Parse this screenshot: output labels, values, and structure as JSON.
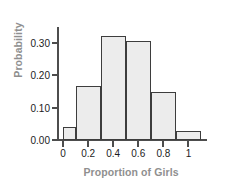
{
  "chart_data": {
    "type": "bar",
    "title": "",
    "subtitle": "",
    "xlabel": "Proportion of Girls",
    "ylabel": "Probability",
    "categories": [
      "0.0-0.1",
      "0.1-0.3",
      "0.3-0.5",
      "0.5-0.7",
      "0.7-0.9",
      "0.9-1.1"
    ],
    "bin_edges": [
      0.0,
      0.1,
      0.3,
      0.5,
      0.7,
      0.9,
      1.1
    ],
    "values": [
      0.04,
      0.167,
      0.32,
      0.305,
      0.147,
      0.027
    ],
    "xlim": [
      -0.04,
      1.14
    ],
    "ylim": [
      0.0,
      0.345
    ],
    "xticks": [
      0,
      0.2,
      0.4,
      0.6,
      0.8,
      1
    ],
    "xtick_labels": [
      "0",
      "0.2",
      "0.4",
      "0.6",
      "0.8",
      "1"
    ],
    "yticks": [
      0.0,
      0.1,
      0.2,
      0.3
    ],
    "ytick_labels": [
      "0.00",
      "0.10",
      "0.20",
      "0.30"
    ],
    "grid": false,
    "legend": null,
    "bar_fill_color": "#ececec",
    "bar_edge_color": "#3d3d3d",
    "axis_color": "#4d4d4d",
    "axis_title_color": "#8f8f8f",
    "tick_label_color": "#1c1c1c",
    "background_color": "#ffffff"
  }
}
